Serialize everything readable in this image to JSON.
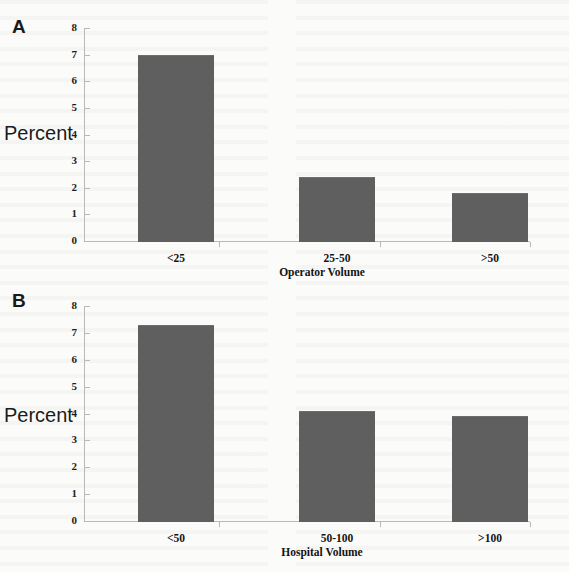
{
  "figure": {
    "background_color": "#fbfbf9",
    "bar_color": "#5f5f5f",
    "axis_color": "#b9b9b9"
  },
  "panels": [
    {
      "letter": "A",
      "ylabel": "Percent",
      "chart": {
        "type": "bar",
        "title": "",
        "xlabel": "Operator Volume",
        "ylabel": "Percent",
        "categories": [
          "<25",
          "25-50",
          ">50"
        ],
        "values": [
          7.0,
          2.4,
          1.8
        ],
        "ylim": [
          0,
          8
        ],
        "yticks": [
          0,
          1,
          2,
          3,
          4,
          5,
          6,
          7,
          8
        ],
        "grid": false,
        "legend": "none"
      }
    },
    {
      "letter": "B",
      "ylabel": "Percent",
      "chart": {
        "type": "bar",
        "title": "",
        "xlabel": "Hospital Volume",
        "ylabel": "Percent",
        "categories": [
          "<50",
          "50-100",
          ">100"
        ],
        "values": [
          7.3,
          4.1,
          3.9
        ],
        "ylim": [
          0,
          8
        ],
        "yticks": [
          0,
          1,
          2,
          3,
          4,
          5,
          6,
          7,
          8
        ],
        "grid": false,
        "legend": "none"
      }
    }
  ],
  "chart_data": [
    {
      "type": "bar",
      "panel": "A",
      "categories": [
        "<25",
        "25-50",
        ">50"
      ],
      "values": [
        7.0,
        2.4,
        1.8
      ],
      "title": "",
      "xlabel": "Operator Volume",
      "ylabel": "Percent",
      "ylim": [
        0,
        8
      ],
      "yticks": [
        0,
        1,
        2,
        3,
        4,
        5,
        6,
        7,
        8
      ],
      "grid": false,
      "legend": "none",
      "series": [
        {
          "name": "Percent",
          "values": [
            7.0,
            2.4,
            1.8
          ]
        }
      ]
    },
    {
      "type": "bar",
      "panel": "B",
      "categories": [
        "<50",
        "50-100",
        ">100"
      ],
      "values": [
        7.3,
        4.1,
        3.9
      ],
      "title": "",
      "xlabel": "Hospital Volume",
      "ylabel": "Percent",
      "ylim": [
        0,
        8
      ],
      "yticks": [
        0,
        1,
        2,
        3,
        4,
        5,
        6,
        7,
        8
      ],
      "grid": false,
      "legend": "none",
      "series": [
        {
          "name": "Percent",
          "values": [
            7.3,
            4.1,
            3.9
          ]
        }
      ]
    }
  ]
}
